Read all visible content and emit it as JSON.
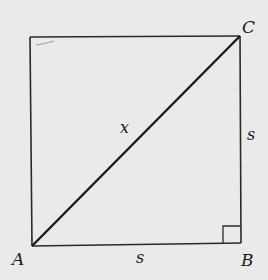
{
  "diagram": {
    "title": "",
    "shape": "square with diagonal",
    "vertices": {
      "A": "A",
      "B": "B",
      "C": "C"
    },
    "labels": {
      "diagonal": "x",
      "side_right": "s",
      "side_bottom": "s"
    },
    "right_angle_marker_at": "B",
    "colors": {
      "background": "#eaeaea",
      "stroke": "#1a1a1a"
    }
  }
}
